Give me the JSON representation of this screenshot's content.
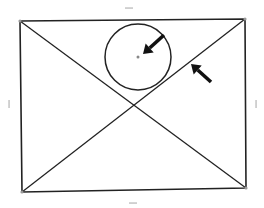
{
  "diagram": {
    "colors": {
      "stroke": "#222222",
      "arrow": "#111111",
      "handle": "#bbbbbb",
      "center_dot": "#888888",
      "background": "#ffffff"
    },
    "rectangle": {
      "corners": {
        "top_left": [
          20,
          21
        ],
        "top_right": [
          245,
          19
        ],
        "bottom_right": [
          246,
          188
        ],
        "bottom_left": [
          22,
          192
        ]
      }
    },
    "diagonals": [
      {
        "from": "top_left",
        "to": "bottom_right"
      },
      {
        "from": "bottom_left",
        "to": "top_right"
      }
    ],
    "circle": {
      "cx": 138,
      "cy": 57,
      "r": 33,
      "center_dot": true
    },
    "arrows": [
      {
        "name": "arrow-to-circle-center",
        "from": [
          164,
          35
        ],
        "to": [
          143,
          54
        ]
      },
      {
        "name": "arrow-to-diagonal",
        "from": [
          211,
          82
        ],
        "to": [
          191,
          64
        ]
      }
    ],
    "handles": [
      {
        "name": "top-handle",
        "x": 129,
        "y": 8,
        "orient": "h"
      },
      {
        "name": "bottom-handle",
        "x": 133,
        "y": 203,
        "orient": "h"
      },
      {
        "name": "left-handle",
        "x": 9,
        "y": 104,
        "orient": "v"
      },
      {
        "name": "right-handle",
        "x": 256,
        "y": 104,
        "orient": "v"
      }
    ]
  }
}
